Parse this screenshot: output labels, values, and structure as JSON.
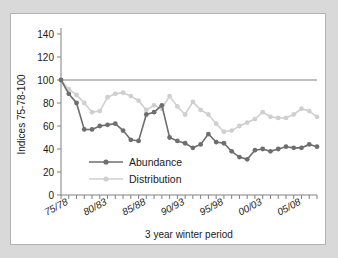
{
  "figure": {
    "background": "#ffffff",
    "outer_background": "#d9d9d9",
    "border_color": "#b3b3b3"
  },
  "chart_data": {
    "type": "line",
    "title": "",
    "xlabel": "3 year winter period",
    "ylabel": "Indices  75-78-100",
    "ylim": [
      0,
      140
    ],
    "yticks": [
      0,
      20,
      40,
      60,
      80,
      100,
      120,
      140
    ],
    "grid": "reference line at 100",
    "reference_line": 100,
    "legend_position": "inside lower-left",
    "x_tick_labels": [
      "75/78",
      "80/83",
      "85/88",
      "90/93",
      "95/98",
      "00/03",
      "05/08"
    ],
    "x_tick_indices": [
      1,
      6,
      11,
      16,
      21,
      26,
      31
    ],
    "x": [
      "74/77",
      "75/78",
      "76/79",
      "77/80",
      "78/81",
      "79/82",
      "80/83",
      "81/84",
      "82/85",
      "83/86",
      "84/87",
      "85/88",
      "86/89",
      "87/90",
      "88/91",
      "89/92",
      "90/93",
      "91/94",
      "92/95",
      "93/96",
      "94/97",
      "95/98",
      "96/99",
      "97/00",
      "98/01",
      "99/02",
      "00/03",
      "01/04",
      "02/05",
      "03/06",
      "04/07",
      "05/08",
      "06/09",
      "07/10"
    ],
    "series": [
      {
        "name": "Abundance",
        "color": "#6e6e6e",
        "marker": "circle",
        "values": [
          100,
          88,
          80,
          57,
          57,
          60,
          61,
          62,
          56,
          48,
          47,
          70,
          72,
          78,
          50,
          47,
          45,
          41,
          44,
          53,
          46,
          45,
          38,
          33,
          31,
          39,
          40,
          38,
          40,
          42,
          41,
          41,
          44,
          42
        ]
      },
      {
        "name": "Distribution",
        "color": "#cfcfcf",
        "marker": "circle",
        "values": [
          100,
          92,
          87,
          80,
          72,
          73,
          85,
          88,
          89,
          86,
          82,
          74,
          78,
          75,
          86,
          77,
          70,
          81,
          74,
          70,
          62,
          55,
          56,
          60,
          63,
          66,
          72,
          68,
          67,
          67,
          70,
          75,
          73,
          68
        ]
      }
    ]
  },
  "legend": {
    "items": [
      {
        "label": "Abundance",
        "color": "#6e6e6e"
      },
      {
        "label": "Distribution",
        "color": "#cfcfcf"
      }
    ]
  }
}
